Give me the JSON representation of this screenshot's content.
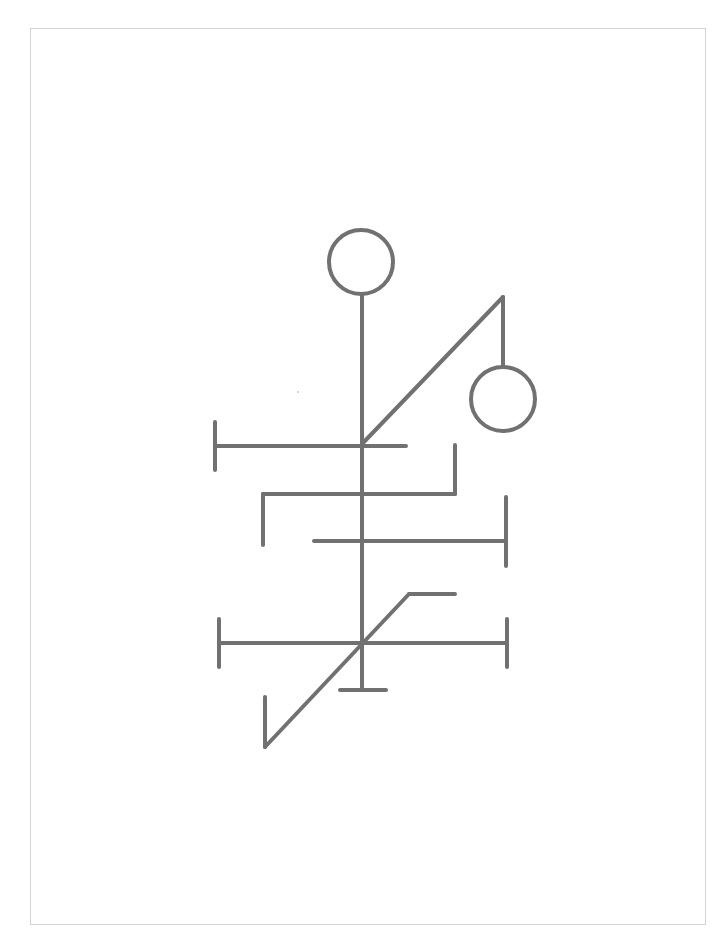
{
  "figure": {
    "stroke_color": "#717171",
    "stroke_width": 4,
    "frame_color": "#d4d4d4",
    "background_color": "#ffffff",
    "frame": {
      "x": 30,
      "y": 28,
      "width": 676,
      "height": 897
    },
    "circles": [
      {
        "id": "top-circle",
        "cx": 361,
        "cy": 262,
        "r": 32
      },
      {
        "id": "right-circle",
        "cx": 503,
        "cy": 399,
        "r": 32
      }
    ],
    "lines": [
      {
        "id": "main-stem",
        "x1": 362,
        "y1": 294,
        "x2": 362,
        "y2": 690
      },
      {
        "id": "upper-diagonal",
        "x1": 362,
        "y1": 444,
        "x2": 503,
        "y2": 297
      },
      {
        "id": "right-circle-stem",
        "x1": 503,
        "y1": 297,
        "x2": 503,
        "y2": 367
      },
      {
        "id": "bar-1",
        "x1": 215,
        "y1": 446,
        "x2": 406,
        "y2": 446
      },
      {
        "id": "bar-1-left-tick",
        "x1": 215,
        "y1": 422,
        "x2": 215,
        "y2": 470
      },
      {
        "id": "bar-2",
        "x1": 263,
        "y1": 494,
        "x2": 455,
        "y2": 494
      },
      {
        "id": "bar-2-left-drop",
        "x1": 263,
        "y1": 494,
        "x2": 263,
        "y2": 545
      },
      {
        "id": "bar-2-right-rise",
        "x1": 455,
        "y1": 445,
        "x2": 455,
        "y2": 494
      },
      {
        "id": "bar-3",
        "x1": 314,
        "y1": 541,
        "x2": 506,
        "y2": 541
      },
      {
        "id": "bar-3-right-tick",
        "x1": 506,
        "y1": 497,
        "x2": 506,
        "y2": 566
      },
      {
        "id": "bar-4",
        "x1": 219,
        "y1": 643,
        "x2": 507,
        "y2": 643
      },
      {
        "id": "bar-4-left-tick",
        "x1": 219,
        "y1": 619,
        "x2": 219,
        "y2": 667
      },
      {
        "id": "bar-4-right-tick",
        "x1": 507,
        "y1": 619,
        "x2": 507,
        "y2": 667
      },
      {
        "id": "foot-bar",
        "x1": 340,
        "y1": 690,
        "x2": 386,
        "y2": 690
      },
      {
        "id": "top-stub",
        "x1": 409,
        "y1": 594,
        "x2": 455,
        "y2": 594
      },
      {
        "id": "lower-diagonal",
        "x1": 409,
        "y1": 594,
        "x2": 265,
        "y2": 747
      },
      {
        "id": "lower-left-riser",
        "x1": 265,
        "y1": 747,
        "x2": 265,
        "y2": 697
      }
    ]
  }
}
